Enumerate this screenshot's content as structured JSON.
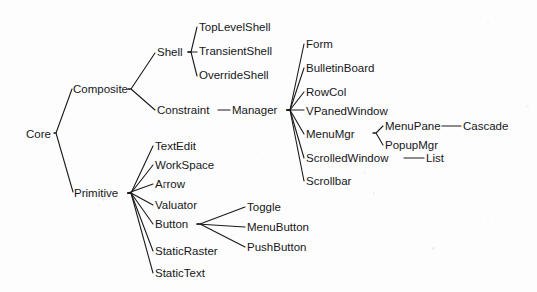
{
  "figure": {
    "kind": "class-hierarchy-tree",
    "orientation": "left-to-right",
    "background_color": "#fdfdfd",
    "line_color": "#1a1a1a",
    "text_color": "#16171a"
  },
  "nodes": [
    {
      "id": "core",
      "label": "Core",
      "x": 26,
      "y": 128
    },
    {
      "id": "composite",
      "label": "Composite",
      "x": 73,
      "y": 83
    },
    {
      "id": "primitive",
      "label": "Primitive",
      "x": 74,
      "y": 187
    },
    {
      "id": "shell",
      "label": "Shell",
      "x": 157,
      "y": 46
    },
    {
      "id": "constraint",
      "label": "Constraint",
      "x": 157,
      "y": 104
    },
    {
      "id": "toplevelshell",
      "label": "TopLevelShell",
      "x": 199,
      "y": 21
    },
    {
      "id": "transientshell",
      "label": "TransientShell",
      "x": 199,
      "y": 45
    },
    {
      "id": "overrideshell",
      "label": "OverrideShell",
      "x": 199,
      "y": 69
    },
    {
      "id": "manager",
      "label": "Manager",
      "x": 232,
      "y": 104
    },
    {
      "id": "form",
      "label": "Form",
      "x": 306,
      "y": 38
    },
    {
      "id": "bulletinboard",
      "label": "BulletinBoard",
      "x": 306,
      "y": 62
    },
    {
      "id": "rowcol",
      "label": "RowCol",
      "x": 306,
      "y": 86
    },
    {
      "id": "vpanedwindow",
      "label": "VPanedWindow",
      "x": 306,
      "y": 105
    },
    {
      "id": "menumgr",
      "label": "MenuMgr",
      "x": 306,
      "y": 128
    },
    {
      "id": "scrolledwindow",
      "label": "ScrolledWindow",
      "x": 306,
      "y": 152
    },
    {
      "id": "scrollbar",
      "label": "Scrollbar",
      "x": 306,
      "y": 175
    },
    {
      "id": "menupane",
      "label": "MenuPane",
      "x": 385,
      "y": 120
    },
    {
      "id": "popupmgr",
      "label": "PopupMgr",
      "x": 385,
      "y": 139
    },
    {
      "id": "cascade",
      "label": "Cascade",
      "x": 463,
      "y": 120
    },
    {
      "id": "list",
      "label": "List",
      "x": 426,
      "y": 152
    },
    {
      "id": "textedit",
      "label": "TextEdit",
      "x": 155,
      "y": 140
    },
    {
      "id": "workspace",
      "label": "WorkSpace",
      "x": 155,
      "y": 159
    },
    {
      "id": "arrow",
      "label": "Arrow",
      "x": 155,
      "y": 178
    },
    {
      "id": "valuator",
      "label": "Valuator",
      "x": 155,
      "y": 199
    },
    {
      "id": "button",
      "label": "Button",
      "x": 155,
      "y": 218
    },
    {
      "id": "staticraster",
      "label": "StaticRaster",
      "x": 155,
      "y": 245
    },
    {
      "id": "statictext",
      "label": "StaticText",
      "x": 155,
      "y": 267
    },
    {
      "id": "toggle",
      "label": "Toggle",
      "x": 247,
      "y": 201
    },
    {
      "id": "menubutton",
      "label": "MenuButton",
      "x": 247,
      "y": 221
    },
    {
      "id": "pushbutton",
      "label": "PushButton",
      "x": 247,
      "y": 241
    }
  ],
  "edges": [
    {
      "id": "core-composite",
      "from": "Core",
      "to": "Composite",
      "points": "54,133 56,133 72,89"
    },
    {
      "id": "core-primitive",
      "from": "Core",
      "to": "Primitive",
      "points": "54,133 56,133 73,192"
    },
    {
      "id": "composite-shell",
      "from": "Composite",
      "to": "Shell",
      "points": "128,89 131,89 155,53"
    },
    {
      "id": "composite-constraint",
      "from": "Composite",
      "to": "Constraint",
      "points": "128,89 131,89 155,110"
    },
    {
      "id": "shell-toplevelshell",
      "from": "Shell",
      "to": "TopLevelShell",
      "points": "188,52 191,52 197,27"
    },
    {
      "id": "shell-transientshell",
      "from": "Shell",
      "to": "TransientShell",
      "points": "188,52 197,52"
    },
    {
      "id": "shell-overrideshell",
      "from": "Shell",
      "to": "OverrideShell",
      "points": "188,52 191,52 197,76"
    },
    {
      "id": "constraint-manager",
      "from": "Constraint",
      "to": "Manager",
      "points": "218,110 230,110"
    },
    {
      "id": "manager-form",
      "from": "Manager",
      "to": "Form",
      "points": "287,110 290,110 304,44"
    },
    {
      "id": "manager-bulletinboard",
      "from": "Manager",
      "to": "BulletinBoard",
      "points": "287,110 290,110 304,68"
    },
    {
      "id": "manager-rowcol",
      "from": "Manager",
      "to": "RowCol",
      "points": "287,110 290,110 304,92"
    },
    {
      "id": "manager-vpanedwindow",
      "from": "Manager",
      "to": "VPanedWindow",
      "points": "287,110 304,110"
    },
    {
      "id": "manager-menumgr",
      "from": "Manager",
      "to": "MenuMgr",
      "points": "287,110 290,110 304,134"
    },
    {
      "id": "manager-scrolledwindow",
      "from": "Manager",
      "to": "ScrolledWindow",
      "points": "287,110 290,110 304,158"
    },
    {
      "id": "manager-scrollbar",
      "from": "Manager",
      "to": "Scrollbar",
      "points": "287,110 290,110 304,181"
    },
    {
      "id": "menumgr-menupane",
      "from": "MenuMgr",
      "to": "MenuPane",
      "points": "373,133 376,133 383,126"
    },
    {
      "id": "menumgr-popupmgr",
      "from": "MenuMgr",
      "to": "PopupMgr",
      "points": "373,133 376,133 383,145"
    },
    {
      "id": "menupane-cascade",
      "from": "MenuPane",
      "to": "Cascade",
      "points": "442,126 461,126"
    },
    {
      "id": "scrolledwindow-list",
      "from": "ScrolledWindow",
      "to": "List",
      "points": "404,158 424,158"
    },
    {
      "id": "primitive-textedit",
      "from": "Primitive",
      "to": "TextEdit",
      "points": "128,193 131,193 153,146"
    },
    {
      "id": "primitive-workspace",
      "from": "Primitive",
      "to": "WorkSpace",
      "points": "128,193 131,193 153,165"
    },
    {
      "id": "primitive-arrow",
      "from": "Primitive",
      "to": "Arrow",
      "points": "128,193 153,184"
    },
    {
      "id": "primitive-valuator",
      "from": "Primitive",
      "to": "Valuator",
      "points": "128,193 131,193 153,205"
    },
    {
      "id": "primitive-button",
      "from": "Primitive",
      "to": "Button",
      "points": "128,193 131,193 153,224"
    },
    {
      "id": "primitive-staticraster",
      "from": "Primitive",
      "to": "StaticRaster",
      "points": "128,193 131,193 153,251"
    },
    {
      "id": "primitive-statictext",
      "from": "Primitive",
      "to": "StaticText",
      "points": "128,193 131,193 153,273"
    },
    {
      "id": "button-toggle",
      "from": "Button",
      "to": "Toggle",
      "points": "197,224 200,224 245,207"
    },
    {
      "id": "button-menubutton",
      "from": "Button",
      "to": "MenuButton",
      "points": "197,224 245,227"
    },
    {
      "id": "button-pushbutton",
      "from": "Button",
      "to": "PushButton",
      "points": "197,224 200,224 245,247"
    }
  ]
}
